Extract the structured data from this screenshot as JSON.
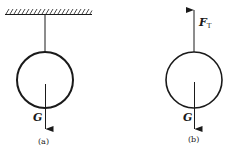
{
  "figure_a": {
    "caption": "(a)",
    "weight_label": "G",
    "description": "Ball suspended by string from ceiling"
  },
  "figure_b": {
    "caption": "(b)",
    "weight_label": "G",
    "tension_label_main": "F",
    "tension_label_sub": "T",
    "description": "Free-body diagram of ball"
  },
  "colors": {
    "stroke": "#1a1a1a",
    "background": "#ffffff"
  }
}
